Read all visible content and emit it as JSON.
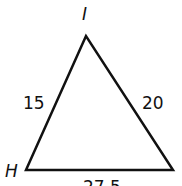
{
  "diagram": {
    "type": "triangle",
    "vertices": {
      "top": "I",
      "left": "H"
    },
    "sides": {
      "left": "15",
      "right": "20",
      "bottom": "27.5"
    },
    "stroke_color": "#111111"
  }
}
